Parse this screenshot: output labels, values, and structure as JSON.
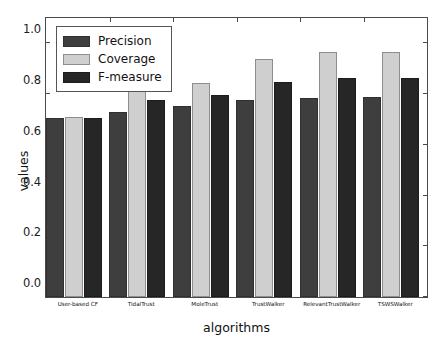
{
  "chart_data": {
    "type": "bar",
    "title": "",
    "subtitle": "",
    "xlabel": "algorithms",
    "ylabel": "values",
    "ylim": [
      0.0,
      1.1
    ],
    "yticks": [
      "0.0",
      "0.2",
      "0.4",
      "0.6",
      "0.8",
      "1.0"
    ],
    "ytick_values": [
      0.0,
      0.2,
      0.4,
      0.6,
      0.8,
      1.0
    ],
    "grid": false,
    "legend_position": "upper left",
    "categories": [
      "User-based CF",
      "TidalTrust",
      "MoleTrust",
      "TrustWalker",
      "RelevantTrustWalker",
      "TSWSWalker"
    ],
    "series": [
      {
        "name": "Precision",
        "color": "#3e3e3e",
        "values": [
          0.705,
          0.73,
          0.755,
          0.775,
          0.785,
          0.79
        ]
      },
      {
        "name": "Coverage",
        "color": "#cfcfcf",
        "values": [
          0.71,
          0.82,
          0.843,
          0.94,
          0.965,
          0.965
        ]
      },
      {
        "name": "F-measure",
        "color": "#262626",
        "values": [
          0.705,
          0.775,
          0.798,
          0.848,
          0.862,
          0.865
        ]
      }
    ]
  },
  "legend": {
    "items": [
      {
        "label": "Precision",
        "swatch": "precision"
      },
      {
        "label": "Coverage",
        "swatch": "coverage"
      },
      {
        "label": "F-measure",
        "swatch": "fmeasure"
      }
    ]
  }
}
